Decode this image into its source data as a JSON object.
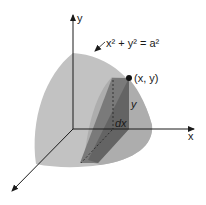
{
  "figure": {
    "labels": {
      "y_axis": "y",
      "x_axis": "x",
      "equation": "x² + y² = a²",
      "point": "(x, y)",
      "height": "y",
      "thickness": "dx"
    },
    "colors": {
      "solid_outer": "#bdbdbd",
      "solid_inner": "#a6a6a6",
      "slice_front": "#7d7d7d",
      "slice_side": "#5e5e5e",
      "axis": "#1a1a1a"
    }
  }
}
